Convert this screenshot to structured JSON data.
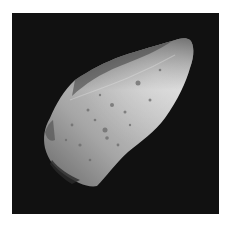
{
  "image": {
    "subject": "asteroid",
    "style": "grayscale photograph",
    "background_color": "#111111",
    "border_color": "#ffffff",
    "surface_light": "#d8d8d8",
    "surface_mid": "#a8a8a8",
    "surface_dark": "#4a4a4a"
  }
}
